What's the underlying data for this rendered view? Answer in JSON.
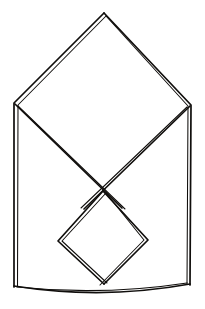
{
  "image": {
    "title": "Folded napkin sketch",
    "description": "Hand-drawn black ink line drawing of a folded cloth napkin forming an envelope shape",
    "width": 205,
    "height": 309,
    "background_color": "#ffffff",
    "ink_color": "#100e0c",
    "style": "double-stroke hand-drawn pen outline, no fill, no text labels",
    "text_labels": []
  },
  "figure": {
    "name": "folded-napkin-envelope",
    "parts": [
      {
        "name": "outer-envelope-body",
        "description": "Outer silhouette: pointed top apex, two upper slanted sides, two vertical sides, slightly curved bottom"
      },
      {
        "name": "large-diamond-flap",
        "description": "Large square flap rotated 45 degrees with its lower edges crossing near the center"
      },
      {
        "name": "small-diamond-flap",
        "description": "Smaller square flap rotated 45 degrees sitting in the lower half, its bottom point reaching the base line"
      },
      {
        "name": "bottom-lens-edge",
        "description": "Shallow double curve along the bottom suggesting the folded base"
      }
    ]
  },
  "geometry": {
    "apex": [
      104,
      13
    ],
    "left_corner": [
      13,
      104
    ],
    "right_corner": [
      191,
      105
    ],
    "bottom_left": [
      14,
      287
    ],
    "bottom_right": [
      190,
      285
    ],
    "crossing_point": [
      103,
      193
    ],
    "inner_diamond": {
      "top": [
        103,
        193
      ],
      "left": [
        58,
        241
      ],
      "right": [
        148,
        240
      ],
      "bottom": [
        104,
        284
      ]
    }
  },
  "paths": {
    "outer_outline_a": "M 104 13 L 14 103 L 14 287",
    "outer_outline_b": "M 104 13 L 191 105 L 190 285",
    "outer_outline_inner_a": "M 106 16 L 18 105 L 17.5 286",
    "outer_outline_inner_b": "M 106 16 L 188 106 L 187 284",
    "bottom_curve_outer": "M 14 286 Q 102 300 190 284",
    "bottom_curve_inner": "M 17 287 Q 102 296 187 283",
    "diamond_lower_left": "M 15 104 L 122 208",
    "diamond_lower_left_b": "M 18 106 L 125 209",
    "diamond_lower_right": "M 190 106 L 84 209",
    "diamond_lower_right_b": "M 187 107 L 81 208",
    "small_diamond_a": "M 103 191 L 58 241 L 104 284",
    "small_diamond_b": "M 106 193 L 62 241 L 107 283",
    "small_diamond_c": "M 103 191 L 148 240 L 104 284",
    "small_diamond_d": "M 106 193 L 144 240 L 100 285"
  }
}
